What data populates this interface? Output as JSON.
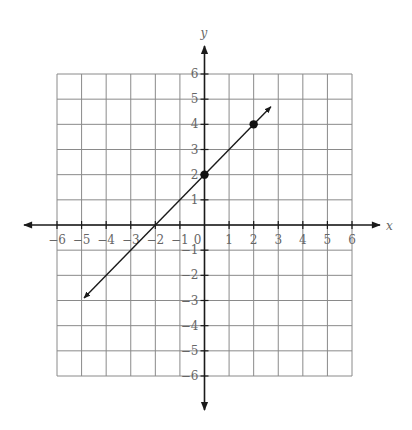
{
  "chart_data": {
    "type": "line",
    "title": "",
    "xlabel": "x",
    "ylabel": "y",
    "xlim": [
      -6,
      6
    ],
    "ylim": [
      -6,
      6
    ],
    "grid": true,
    "x_ticks": [
      -6,
      -5,
      -4,
      -3,
      -2,
      -1,
      0,
      1,
      2,
      3,
      4,
      5,
      6
    ],
    "y_ticks": [
      -6,
      -5,
      -4,
      -3,
      -2,
      -1,
      1,
      2,
      3,
      4,
      5,
      6
    ],
    "x_tick_labels": [
      "−6",
      "−5",
      "−4",
      "−3",
      "−2",
      "−1",
      "0",
      "1",
      "2",
      "3",
      "4",
      "5",
      "6"
    ],
    "y_tick_labels": [
      "−6",
      "−5",
      "−4",
      "−3",
      "−2",
      "−1",
      "1",
      "2",
      "3",
      "4",
      "5",
      "6"
    ],
    "series": [
      {
        "name": "line y = x + 2",
        "kind": "line-with-arrows",
        "x": [
          -4.9,
          2.7
        ],
        "y": [
          -2.9,
          4.7
        ]
      },
      {
        "name": "plotted points",
        "kind": "scatter",
        "points": [
          {
            "x": 0,
            "y": 2
          },
          {
            "x": 2,
            "y": 4
          }
        ]
      }
    ],
    "colors": {
      "grid": "#8a8a8a",
      "axis": "#1a1a1a",
      "line": "#1a1a1a",
      "labels": "#666666"
    }
  }
}
